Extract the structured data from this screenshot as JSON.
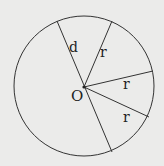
{
  "diagram": {
    "type": "circle-geometry",
    "center_label": "O",
    "labels": {
      "diameter": "d",
      "radius_1": "r",
      "radius_2": "r",
      "radius_3": "r"
    },
    "colors": {
      "background": "#ebebea",
      "stroke": "#333333",
      "text": "#222222"
    }
  }
}
